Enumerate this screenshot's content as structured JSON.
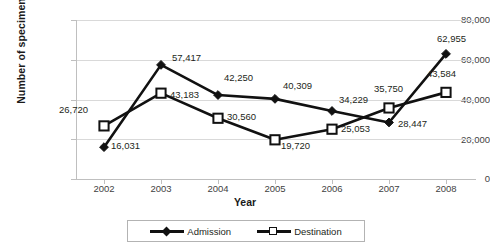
{
  "chart_data": {
    "type": "line",
    "title": "",
    "xlabel": "Year",
    "ylabel": "Number of specimens",
    "categories": [
      "2002",
      "2003",
      "2004",
      "2005",
      "2006",
      "2007",
      "2008"
    ],
    "ylim": [
      0,
      80000
    ],
    "yticks": [
      "0",
      "20,000",
      "40,000",
      "60,000",
      "80,000"
    ],
    "ytick_values": [
      0,
      20000,
      40000,
      60000,
      80000
    ],
    "grid": true,
    "legend_position": "bottom",
    "series": [
      {
        "name": "Admission",
        "marker": "filled-diamond",
        "values": [
          16031,
          57417,
          42250,
          40309,
          34229,
          28447,
          62955
        ],
        "labels": [
          "16,031",
          "57,417",
          "42,250",
          "40,309",
          "34,229",
          "28,447",
          "62,955"
        ]
      },
      {
        "name": "Destination",
        "marker": "open-square",
        "values": [
          26720,
          43183,
          30560,
          19720,
          25053,
          35750,
          43584
        ],
        "labels": [
          "26,720",
          "43,183",
          "30,560",
          "19,720",
          "25,053",
          "35,750",
          "43,584"
        ]
      }
    ]
  },
  "legend": {
    "items": [
      {
        "label": "Admission",
        "marker": "filled-diamond"
      },
      {
        "label": "Destination",
        "marker": "open-square"
      }
    ]
  },
  "colors": {
    "series_line": "#111111",
    "gridline": "#d9d9d9",
    "axis": "#bfbfbf",
    "text": "#231f20"
  }
}
